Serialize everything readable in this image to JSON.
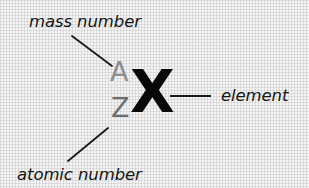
{
  "diagram": {
    "background_color": "#f4f4f4",
    "labels": {
      "mass_number": "mass number",
      "atomic_number": "atomic number",
      "element": "element"
    },
    "symbols": {
      "mass_number_value": "A",
      "atomic_number_value": "Z",
      "element_symbol": "X"
    },
    "colors": {
      "mass_number_value": "#8d8d8d",
      "atomic_number_value": "#6f6f6f",
      "element_symbol": "#080808",
      "label_text": "#151515",
      "leader_line": "#1a1a1a"
    },
    "leader_lines": [
      {
        "name": "mass-number-leader",
        "from_label": "mass number",
        "to_symbol": "A",
        "x1": 72,
        "y1": 36,
        "x2": 112,
        "y2": 66
      },
      {
        "name": "atomic-number-leader",
        "from_label": "atomic number",
        "to_symbol": "Z",
        "x1": 68,
        "y1": 161,
        "x2": 108,
        "y2": 128
      },
      {
        "name": "element-leader",
        "from_label": "element",
        "to_symbol": "X",
        "x1": 170,
        "y1": 96,
        "x2": 211,
        "y2": 96
      }
    ]
  }
}
